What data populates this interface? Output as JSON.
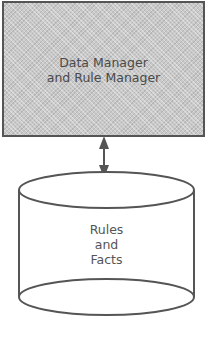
{
  "diagram": {
    "manager_box": {
      "label": "Data Manager\nand Rule Manager"
    },
    "connector": {
      "type": "bidirectional-arrow"
    },
    "storage": {
      "shape": "cylinder",
      "label": "Rules\nand\nFacts"
    },
    "colors": {
      "box_fill": "#c9c9c9",
      "stroke": "#555555",
      "text": "#4a4a4a"
    }
  }
}
